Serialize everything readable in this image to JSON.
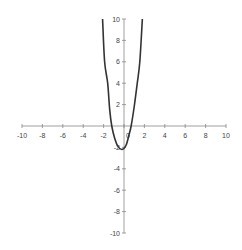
{
  "chart_data": {
    "type": "line",
    "title": "",
    "xlabel": "",
    "ylabel": "",
    "xlim": [
      -10,
      10
    ],
    "ylim": [
      -10,
      10
    ],
    "grid": false,
    "legend": null,
    "x_ticks": [
      -10,
      -8,
      -6,
      -4,
      -2,
      0,
      2,
      4,
      6,
      8,
      10
    ],
    "y_ticks": [
      -10,
      -8,
      -6,
      -4,
      -2,
      2,
      4,
      6,
      8,
      10
    ],
    "x_tick_labels": [
      "-10",
      "-8",
      "-6",
      "-4",
      "-2",
      "0",
      "2",
      "4",
      "6",
      "8",
      "10"
    ],
    "y_tick_labels": [
      "-10",
      "-8",
      "-6",
      "-4",
      "-2",
      "2",
      "4",
      "6",
      "8",
      "10"
    ],
    "series": [
      {
        "name": "curve",
        "color": "#333333",
        "x": [
          -2.1,
          -1.9,
          -1.6,
          -1.4,
          -1.2,
          -0.9,
          -0.6,
          -0.2,
          0.2,
          0.5,
          0.7,
          1.0,
          1.3,
          1.55,
          1.8
        ],
        "y": [
          10,
          6,
          4,
          1.5,
          0,
          -1.2,
          -1.9,
          -2.2,
          -1.8,
          -0.8,
          0,
          1.8,
          4,
          6,
          10
        ]
      }
    ]
  }
}
